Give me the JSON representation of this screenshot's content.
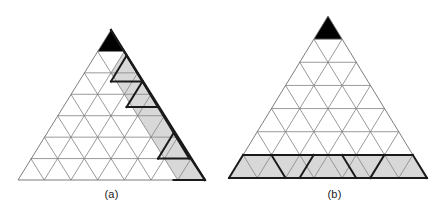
{
  "figure": {
    "width": 446,
    "height": 213,
    "background": "#ffffff",
    "panels": [
      {
        "id": "a",
        "caption": "(a)",
        "rows": 7,
        "apex": {
          "x": 111,
          "y": 30
        },
        "bottom_left": {
          "x": 18,
          "y": 180
        },
        "bottom_right": {
          "x": 205,
          "y": 180
        },
        "grid_color": "#808080",
        "grid_width": 0.8,
        "outline_color": "#6e6e6e",
        "outline_width": 0.9,
        "shade_color": "#d8d8d8",
        "black_color": "#000000",
        "thick_color": "#1a1a1a",
        "thick_width": 2.0,
        "black_cells": [
          {
            "row": 1,
            "index": 0
          }
        ],
        "shaded_cells": [
          {
            "row": 2,
            "index": 2
          },
          {
            "row": 3,
            "index": 3
          },
          {
            "row": 3,
            "index": 4
          },
          {
            "row": 4,
            "index": 5
          },
          {
            "row": 4,
            "index": 6
          },
          {
            "row": 5,
            "index": 7
          },
          {
            "row": 5,
            "index": 8
          },
          {
            "row": 6,
            "index": 9
          },
          {
            "row": 6,
            "index": 10
          },
          {
            "row": 7,
            "index": 11
          },
          {
            "row": 7,
            "index": 12
          }
        ],
        "thick_edges": [
          {
            "x1": 111,
            "y1": 30,
            "x2": 142.5,
            "y2": 81.4
          },
          {
            "x1": 142.5,
            "y1": 81.4,
            "x2": 111,
            "y2": 81.4
          },
          {
            "x1": 111,
            "y1": 81.4,
            "x2": 126.6,
            "y2": 55.7
          },
          {
            "x1": 126.6,
            "y1": 55.7,
            "x2": 158.1,
            "y2": 107.1
          },
          {
            "x1": 158.1,
            "y1": 107.1,
            "x2": 126.6,
            "y2": 107.1
          },
          {
            "x1": 126.6,
            "y1": 107.1,
            "x2": 142.5,
            "y2": 81.4
          },
          {
            "x1": 142.5,
            "y1": 81.4,
            "x2": 189.3,
            "y2": 158.6
          },
          {
            "x1": 189.3,
            "y1": 158.6,
            "x2": 158.1,
            "y2": 158.6
          },
          {
            "x1": 158.1,
            "y1": 158.6,
            "x2": 173.7,
            "y2": 132.9
          },
          {
            "x1": 173.7,
            "y1": 132.9,
            "x2": 205,
            "y2": 180
          },
          {
            "x1": 205,
            "y1": 180,
            "x2": 173.7,
            "y2": 180
          },
          {
            "x1": 111,
            "y1": 30,
            "x2": 205,
            "y2": 180
          },
          {
            "x1": 173.7,
            "y1": 180,
            "x2": 205,
            "y2": 180
          }
        ]
      },
      {
        "id": "b",
        "caption": "(b)",
        "rows": 7,
        "apex": {
          "x": 105,
          "y": 16
        },
        "bottom_left": {
          "x": 6,
          "y": 178
        },
        "bottom_right": {
          "x": 204,
          "y": 178
        },
        "grid_color": "#808080",
        "grid_width": 0.8,
        "outline_color": "#6e6e6e",
        "outline_width": 0.9,
        "shade_color": "#d8d8d8",
        "black_color": "#000000",
        "thick_color": "#1a1a1a",
        "thick_width": 2.0,
        "black_cells": [
          {
            "row": 1,
            "index": 0
          }
        ],
        "shaded_cells": [
          {
            "row": 7,
            "index": 0
          },
          {
            "row": 7,
            "index": 1
          },
          {
            "row": 7,
            "index": 2
          },
          {
            "row": 7,
            "index": 3
          },
          {
            "row": 7,
            "index": 4
          },
          {
            "row": 7,
            "index": 5
          },
          {
            "row": 7,
            "index": 6
          },
          {
            "row": 7,
            "index": 7
          },
          {
            "row": 7,
            "index": 8
          },
          {
            "row": 7,
            "index": 9
          },
          {
            "row": 7,
            "index": 10
          },
          {
            "row": 7,
            "index": 11
          },
          {
            "row": 7,
            "index": 12
          }
        ],
        "thick_edges": [
          {
            "x1": 6,
            "y1": 178,
            "x2": 204,
            "y2": 178
          },
          {
            "x1": 20.1,
            "y1": 154.9,
            "x2": 189.8,
            "y2": 154.9
          },
          {
            "x1": 6,
            "y1": 178,
            "x2": 20.1,
            "y2": 154.9
          },
          {
            "x1": 48.4,
            "y1": 154.9,
            "x2": 62.5,
            "y2": 178
          },
          {
            "x1": 76.6,
            "y1": 178,
            "x2": 90.7,
            "y2": 154.9
          },
          {
            "x1": 119,
            "y1": 154.9,
            "x2": 133.1,
            "y2": 178
          },
          {
            "x1": 147.2,
            "y1": 178,
            "x2": 161.4,
            "y2": 154.9
          },
          {
            "x1": 189.8,
            "y1": 154.9,
            "x2": 204,
            "y2": 178
          }
        ]
      }
    ]
  }
}
